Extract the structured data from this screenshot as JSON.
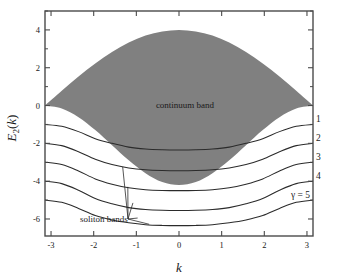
{
  "figure": {
    "title": "",
    "xlabel": "k",
    "ylabel_main": "E",
    "ylabel_sub": "2",
    "ylabel_arg": "(k)",
    "background_color": "#ffffff",
    "band_color": "#808080",
    "curve_color": "#2b2b2b",
    "axis_color": "#4a4a4a"
  },
  "annotations": {
    "continuum": "continuum band",
    "soliton": "soliton bands",
    "gamma_series": "γ = 5"
  },
  "curve_labels": [
    "1",
    "2",
    "3",
    "4"
  ],
  "chart_data": {
    "type": "line",
    "title": "",
    "xlabel": "k",
    "ylabel": "E_2(k)",
    "xlim": [
      -3.14159,
      3.14159
    ],
    "ylim": [
      -6.9,
      5.0
    ],
    "xticks": [
      -3,
      -2,
      -1,
      0,
      1,
      2,
      3
    ],
    "xtick_labels": [
      "-3",
      "-2",
      "-1",
      "0",
      "1",
      "2",
      "3"
    ],
    "yticks": [
      4,
      2,
      0,
      -2,
      -4,
      -6
    ],
    "ytick_labels": [
      "4",
      "2",
      "0",
      "-2",
      "-4",
      "-6"
    ],
    "grid": false,
    "legend_position": "right-inline",
    "shaded_region": {
      "name": "continuum band",
      "color": "#808080",
      "upper_boundary": {
        "description": "E = 4*cos(k/2), from 0 at k=-pi up to 4 at k=0 back to 0 at k=+pi",
        "x": [
          -3.14159,
          -2.7489,
          -2.3562,
          -1.9635,
          -1.5708,
          -1.1781,
          -0.7854,
          -0.3927,
          0,
          0.3927,
          0.7854,
          1.1781,
          1.5708,
          1.9635,
          2.3562,
          2.7489,
          3.14159
        ],
        "y": [
          0.0,
          0.78,
          1.53,
          2.22,
          2.83,
          3.33,
          3.7,
          3.92,
          4.0,
          3.92,
          3.7,
          3.33,
          2.83,
          2.22,
          1.53,
          0.78,
          0.0
        ]
      },
      "lower_boundary": {
        "description": "E = -4.2*cos(k/2)^2 style dip, 0 at k=+-pi down to -4.2 at k=0",
        "x": [
          -3.14159,
          -2.7489,
          -2.3562,
          -1.9635,
          -1.5708,
          -1.1781,
          -0.7854,
          -0.3927,
          0,
          0.3927,
          0.7854,
          1.1781,
          1.5708,
          1.9635,
          2.3562,
          2.7489,
          3.14159
        ],
        "y": [
          0.0,
          -0.16,
          -0.62,
          -1.3,
          -2.1,
          -2.9,
          -3.58,
          -4.05,
          -4.2,
          -4.05,
          -3.58,
          -2.9,
          -2.1,
          -1.3,
          -0.62,
          -0.16,
          0.0
        ]
      }
    },
    "series": [
      {
        "name": "γ = 1",
        "label": "1",
        "edge_value": -1.0,
        "min_value": -2.35,
        "x": [
          -3.14159,
          -2.7489,
          -2.3562,
          -1.9635,
          -1.5708,
          -1.1781,
          -0.7854,
          -0.3927,
          0,
          0.3927,
          0.7854,
          1.1781,
          1.5708,
          1.9635,
          2.3562,
          2.7489,
          3.14159
        ],
        "y": [
          -1.0,
          -1.1,
          -1.38,
          -1.75,
          -2.0,
          -2.2,
          -2.3,
          -2.34,
          -2.35,
          -2.34,
          -2.3,
          -2.2,
          -2.0,
          -1.75,
          -1.38,
          -1.1,
          -1.0
        ]
      },
      {
        "name": "γ = 2",
        "label": "2",
        "edge_value": -2.0,
        "min_value": -3.45,
        "x": [
          -3.14159,
          -2.7489,
          -2.3562,
          -1.9635,
          -1.5708,
          -1.1781,
          -0.7854,
          -0.3927,
          0,
          0.3927,
          0.7854,
          1.1781,
          1.5708,
          1.9635,
          2.3562,
          2.7489,
          3.14159
        ],
        "y": [
          -2.0,
          -2.12,
          -2.44,
          -2.84,
          -3.12,
          -3.3,
          -3.4,
          -3.44,
          -3.45,
          -3.44,
          -3.4,
          -3.3,
          -3.12,
          -2.84,
          -2.44,
          -2.12,
          -2.0
        ]
      },
      {
        "name": "γ = 3",
        "label": "3",
        "edge_value": -3.0,
        "min_value": -4.5,
        "x": [
          -3.14159,
          -2.7489,
          -2.3562,
          -1.9635,
          -1.5708,
          -1.1781,
          -0.7854,
          -0.3927,
          0,
          0.3927,
          0.7854,
          1.1781,
          1.5708,
          1.9635,
          2.3562,
          2.7489,
          3.14159
        ],
        "y": [
          -3.0,
          -3.12,
          -3.46,
          -3.88,
          -4.16,
          -4.35,
          -4.45,
          -4.49,
          -4.5,
          -4.49,
          -4.45,
          -4.35,
          -4.16,
          -3.88,
          -3.46,
          -3.12,
          -3.0
        ]
      },
      {
        "name": "γ = 4",
        "label": "4",
        "edge_value": -4.0,
        "min_value": -5.55,
        "x": [
          -3.14159,
          -2.7489,
          -2.3562,
          -1.9635,
          -1.5708,
          -1.1781,
          -0.7854,
          -0.3927,
          0,
          0.3927,
          0.7854,
          1.1781,
          1.5708,
          1.9635,
          2.3562,
          2.7489,
          3.14159
        ],
        "y": [
          -4.0,
          -4.13,
          -4.48,
          -4.92,
          -5.2,
          -5.4,
          -5.5,
          -5.54,
          -5.55,
          -5.54,
          -5.5,
          -5.4,
          -5.2,
          -4.92,
          -4.48,
          -4.13,
          -4.0
        ]
      },
      {
        "name": "γ = 5",
        "label": "γ = 5",
        "edge_value": -5.0,
        "min_value": -6.35,
        "x": [
          -3.14159,
          -2.7489,
          -2.3562,
          -1.9635,
          -1.5708,
          -1.1781,
          -0.7854,
          -0.3927,
          0,
          0.3927,
          0.7854,
          1.1781,
          1.5708,
          1.9635,
          2.3562,
          2.7489,
          3.14159
        ],
        "y": [
          -5.0,
          -5.12,
          -5.44,
          -5.82,
          -6.05,
          -6.2,
          -6.3,
          -6.34,
          -6.35,
          -6.34,
          -6.3,
          -6.2,
          -6.05,
          -5.82,
          -5.44,
          -5.12,
          -5.0
        ]
      }
    ]
  }
}
